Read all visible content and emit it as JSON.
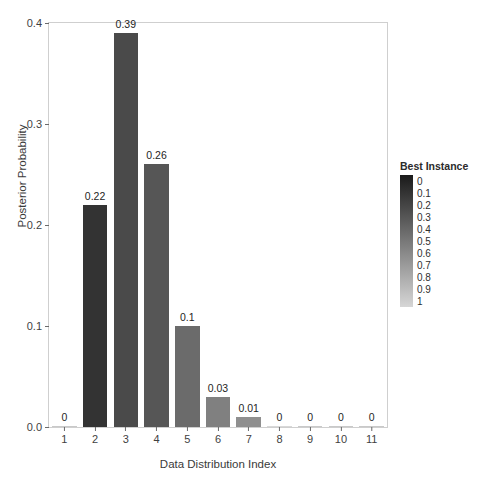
{
  "chart_data": {
    "type": "bar",
    "title": "",
    "xlabel": "Data Distribution Index",
    "ylabel": "Posterior Probability",
    "categories": [
      "1",
      "2",
      "3",
      "4",
      "5",
      "6",
      "7",
      "8",
      "9",
      "10",
      "11"
    ],
    "values": [
      0,
      0.22,
      0.39,
      0.26,
      0.1,
      0.03,
      0.01,
      0,
      0,
      0,
      0
    ],
    "data_labels": [
      "0",
      "0.22",
      "0.39",
      "0.26",
      "0.1",
      "0.03",
      "0.01",
      "0",
      "0",
      "0",
      "0"
    ],
    "bar_colors": [
      "#c9c9c9",
      "#333333",
      "#4a4a4a",
      "#565656",
      "#6b6b6b",
      "#808080",
      "#8f8f8f",
      "#d8d8d8",
      "#c9c9c9",
      "#c9c9c9",
      "#c9c9c9"
    ],
    "xlim": [
      0.5,
      11.5
    ],
    "ylim": [
      0,
      0.4
    ],
    "ytick_labels": [
      "0.0",
      "0.1",
      "0.2",
      "0.3",
      "0.4"
    ],
    "ytick_values": [
      0.0,
      0.1,
      0.2,
      0.3,
      0.4
    ],
    "grid": false,
    "legend_position": "right",
    "legend": {
      "title": "Best Instance",
      "type": "colorbar",
      "labels": [
        "0",
        "0.1",
        "0.2",
        "0.3",
        "0.4",
        "0.5",
        "0.6",
        "0.7",
        "0.8",
        "0.9",
        "1"
      ],
      "gradient_start_color": "#1a1a1a",
      "gradient_end_color": "#d6d6d6"
    }
  }
}
